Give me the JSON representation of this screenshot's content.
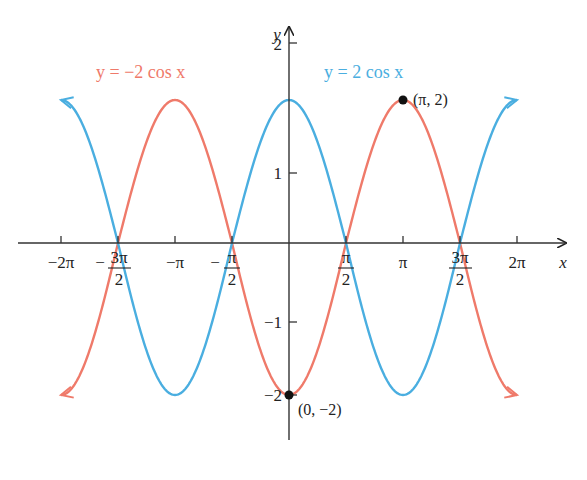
{
  "chart_data": {
    "type": "line",
    "title": "",
    "xlabel": "x",
    "ylabel": "y",
    "xlim": [
      -6.6,
      6.6
    ],
    "ylim": [
      -2.6,
      2.8
    ],
    "grid": false,
    "legend_position": "inline-top",
    "series": [
      {
        "name": "y = −2 cos x",
        "color": "#ef7a6a",
        "function": "-2*cos(x)",
        "x": [
          -6.283,
          -4.712,
          -3.142,
          -1.571,
          0,
          1.571,
          3.142,
          4.712,
          6.283
        ],
        "values": [
          -2,
          0,
          2,
          0,
          -2,
          0,
          2,
          0,
          -2
        ],
        "arrows": "both ends"
      },
      {
        "name": "y = 2 cos x",
        "color": "#4aaee0",
        "function": "2*cos(x)",
        "x": [
          -6.283,
          -4.712,
          -3.142,
          -1.571,
          0,
          1.571,
          3.142,
          4.712,
          6.283
        ],
        "values": [
          2,
          0,
          -2,
          0,
          2,
          0,
          -2,
          0,
          2
        ],
        "arrows": "both ends"
      }
    ],
    "x_ticks": [
      {
        "value": -6.283,
        "label": "−2π"
      },
      {
        "value": -4.712,
        "label_neg": "−",
        "label_num": "3π",
        "label_den": "2"
      },
      {
        "value": -3.142,
        "label": "−π"
      },
      {
        "value": -1.571,
        "label_neg": "−",
        "label_num": "π",
        "label_den": "2"
      },
      {
        "value": 1.571,
        "label_num": "π",
        "label_den": "2"
      },
      {
        "value": 3.142,
        "label": "π"
      },
      {
        "value": 4.712,
        "label_num": "3π",
        "label_den": "2"
      },
      {
        "value": 6.283,
        "label": "2π"
      }
    ],
    "y_ticks": [
      {
        "value": 2,
        "label": "2"
      },
      {
        "value": 1,
        "label": "1"
      },
      {
        "value": -1,
        "label": "−1"
      },
      {
        "value": -2,
        "label": "−2"
      }
    ],
    "annotations": [
      {
        "x": 3.142,
        "y": 2,
        "label": "(π, 2)"
      },
      {
        "x": 0,
        "y": -2,
        "label": "(0, −2)"
      }
    ]
  },
  "labels": {
    "red_curve": "y = −2 cos x",
    "blue_curve": "y = 2 cos x",
    "x_axis": "x",
    "y_axis": "y",
    "pt_pi_2": "(π, 2)",
    "pt_0_neg2": "(0, −2)",
    "x_neg2pi": "−2π",
    "x_negpi": "−π",
    "x_pi": "π",
    "x_2pi": "2π",
    "neg": "−",
    "three_pi": "3π",
    "pi": "π",
    "two": "2",
    "y2": "2",
    "y1": "1",
    "ym1": "−1",
    "ym2": "−2"
  }
}
